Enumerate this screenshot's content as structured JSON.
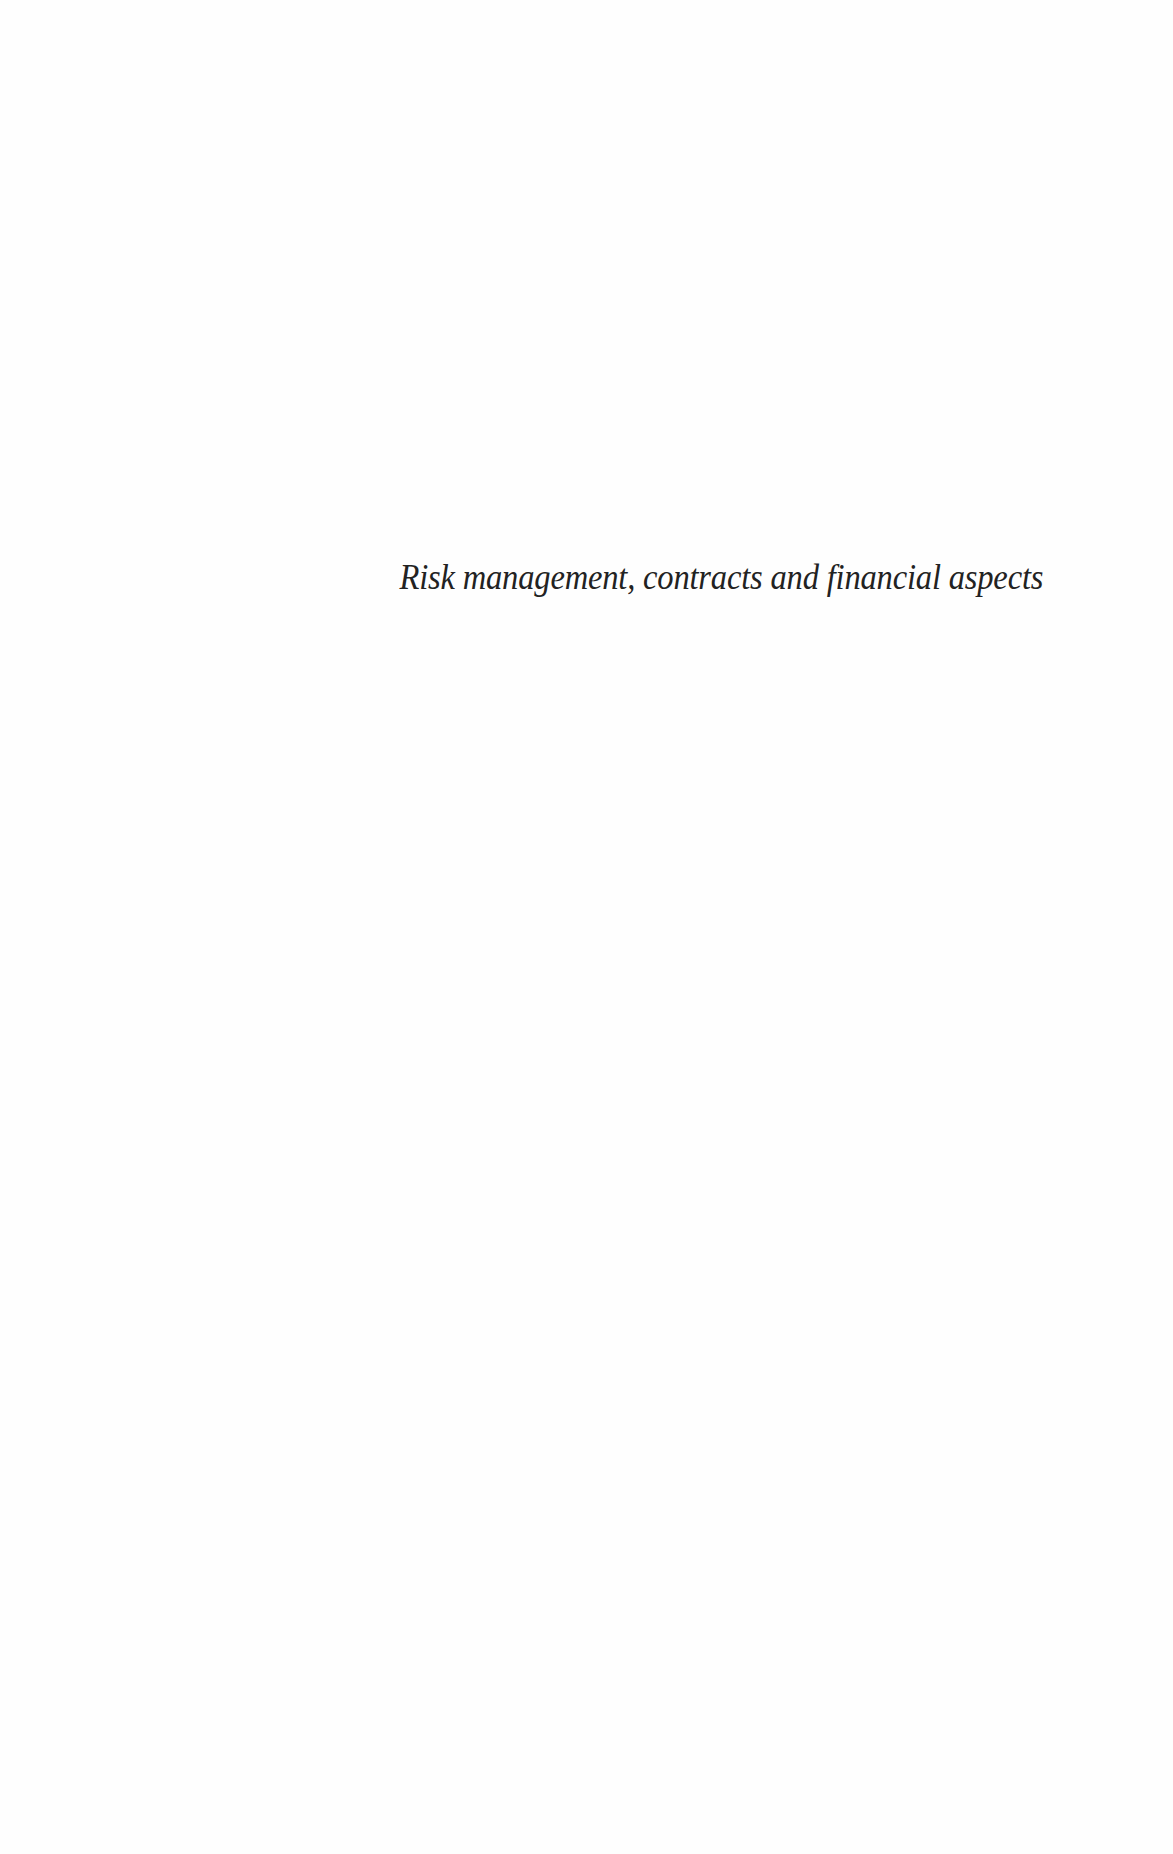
{
  "page": {
    "type": "half-title page",
    "title": "Risk management, contracts and financial aspects"
  }
}
